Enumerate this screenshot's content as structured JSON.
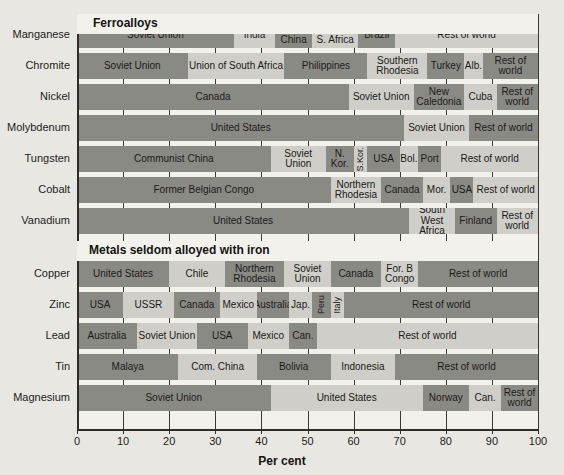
{
  "chart_data": {
    "type": "bar",
    "subtype": "stacked-horizontal-100-percent",
    "title": "",
    "xlabel": "Per cent",
    "ylabel": "",
    "xlim": [
      0,
      100
    ],
    "xticks": [
      0,
      10,
      20,
      30,
      40,
      50,
      60,
      70,
      80,
      90,
      100
    ],
    "grid": true,
    "grid_axis": "x",
    "legend": "none",
    "section_headings": [
      "Ferroalloys",
      "Metals seldom alloyed with iron"
    ],
    "categories": [
      "Manganese",
      "Chromite",
      "Nickel",
      "Molybdenum",
      "Tungsten",
      "Cobalt",
      "Vanadium",
      "Copper",
      "Zinc",
      "Lead",
      "Tin",
      "Magnesium"
    ],
    "colors": {
      "dark_segment": "#8a8a85",
      "light_segment": "#cfcec8",
      "background": "#e8e7e2",
      "plot_background": "#f2f1ec",
      "axis": "#2c2c2a"
    },
    "rows": [
      {
        "category": "Manganese",
        "section": "Ferroalloys",
        "segments": [
          {
            "label": "Soviet Union",
            "value": 34,
            "start": 0,
            "shade": "dark"
          },
          {
            "label": "India",
            "value": 9,
            "start": 34,
            "shade": "light"
          },
          {
            "label": "Com. China",
            "value": 8,
            "start": 43,
            "shade": "dark"
          },
          {
            "label": "Union of S. Africa",
            "value": 10,
            "start": 51,
            "shade": "light"
          },
          {
            "label": "Brazil",
            "value": 8,
            "start": 61,
            "shade": "dark"
          },
          {
            "label": "Rest of world",
            "value": 31,
            "start": 69,
            "shade": "light"
          }
        ]
      },
      {
        "category": "Chromite",
        "section": "Ferroalloys",
        "segments": [
          {
            "label": "Soviet Union",
            "value": 24,
            "start": 0,
            "shade": "dark"
          },
          {
            "label": "Union of South Africa",
            "value": 21,
            "start": 24,
            "shade": "light"
          },
          {
            "label": "Philippines",
            "value": 18,
            "start": 45,
            "shade": "dark"
          },
          {
            "label": "Southern Rhodesia",
            "value": 13,
            "start": 63,
            "shade": "light"
          },
          {
            "label": "Turkey",
            "value": 8,
            "start": 76,
            "shade": "dark"
          },
          {
            "label": "Alb.",
            "value": 4,
            "start": 84,
            "shade": "light"
          },
          {
            "label": "Rest of world",
            "value": 12,
            "start": 88,
            "shade": "dark"
          }
        ]
      },
      {
        "category": "Nickel",
        "section": "Ferroalloys",
        "segments": [
          {
            "label": "Canada",
            "value": 59,
            "start": 0,
            "shade": "dark"
          },
          {
            "label": "Soviet Union",
            "value": 14,
            "start": 59,
            "shade": "light"
          },
          {
            "label": "New Caledonia",
            "value": 11,
            "start": 73,
            "shade": "dark"
          },
          {
            "label": "Cuba",
            "value": 7,
            "start": 84,
            "shade": "light"
          },
          {
            "label": "Rest of world",
            "value": 9,
            "start": 91,
            "shade": "dark"
          }
        ]
      },
      {
        "category": "Molybdenum",
        "section": "Ferroalloys",
        "segments": [
          {
            "label": "United States",
            "value": 71,
            "start": 0,
            "shade": "dark"
          },
          {
            "label": "Soviet Union",
            "value": 14,
            "start": 71,
            "shade": "light"
          },
          {
            "label": "Rest of world",
            "value": 15,
            "start": 85,
            "shade": "dark"
          }
        ]
      },
      {
        "category": "Tungsten",
        "section": "Ferroalloys",
        "segments": [
          {
            "label": "Communist China",
            "value": 42,
            "start": 0,
            "shade": "dark"
          },
          {
            "label": "Soviet Union",
            "value": 12,
            "start": 42,
            "shade": "light"
          },
          {
            "label": "N. Kor.",
            "value": 6,
            "start": 54,
            "shade": "dark"
          },
          {
            "label": "S.Kor.",
            "value": 3,
            "start": 60,
            "shade": "light",
            "orient": "vertical"
          },
          {
            "label": "USA",
            "value": 7,
            "start": 63,
            "shade": "dark"
          },
          {
            "label": "Bol.",
            "value": 4,
            "start": 70,
            "shade": "light"
          },
          {
            "label": "Port",
            "value": 5,
            "start": 74,
            "shade": "dark"
          },
          {
            "label": "Rest of world",
            "value": 21,
            "start": 79,
            "shade": "light"
          }
        ]
      },
      {
        "category": "Cobalt",
        "section": "Ferroalloys",
        "segments": [
          {
            "label": "Former Belgian Congo",
            "value": 55,
            "start": 0,
            "shade": "dark"
          },
          {
            "label": "Northern Rhodesia",
            "value": 11,
            "start": 55,
            "shade": "light"
          },
          {
            "label": "Canada",
            "value": 9,
            "start": 66,
            "shade": "dark"
          },
          {
            "label": "Mor.",
            "value": 6,
            "start": 75,
            "shade": "light"
          },
          {
            "label": "USA",
            "value": 5,
            "start": 81,
            "shade": "dark"
          },
          {
            "label": "Rest of world",
            "value": 14,
            "start": 86,
            "shade": "light"
          }
        ]
      },
      {
        "category": "Vanadium",
        "section": "Ferroalloys",
        "segments": [
          {
            "label": "United States",
            "value": 72,
            "start": 0,
            "shade": "dark"
          },
          {
            "label": "South West Africa",
            "value": 10,
            "start": 72,
            "shade": "light"
          },
          {
            "label": "Finland",
            "value": 9,
            "start": 82,
            "shade": "dark"
          },
          {
            "label": "Rest of world",
            "value": 9,
            "start": 91,
            "shade": "light"
          }
        ]
      },
      {
        "category": "Copper",
        "section": "Metals seldom alloyed with iron",
        "segments": [
          {
            "label": "United States",
            "value": 20,
            "start": 0,
            "shade": "dark"
          },
          {
            "label": "Chile",
            "value": 12,
            "start": 20,
            "shade": "light"
          },
          {
            "label": "Northern Rhodesia",
            "value": 13,
            "start": 32,
            "shade": "dark"
          },
          {
            "label": "Soviet Union",
            "value": 10,
            "start": 45,
            "shade": "light"
          },
          {
            "label": "Canada",
            "value": 11,
            "start": 55,
            "shade": "dark"
          },
          {
            "label": "For. B Congo",
            "value": 8,
            "start": 66,
            "shade": "light"
          },
          {
            "label": "Rest of world",
            "value": 26,
            "start": 74,
            "shade": "dark"
          }
        ]
      },
      {
        "category": "Zinc",
        "section": "Metals seldom alloyed with iron",
        "segments": [
          {
            "label": "USA",
            "value": 10,
            "start": 0,
            "shade": "dark"
          },
          {
            "label": "USSR",
            "value": 11,
            "start": 10,
            "shade": "light"
          },
          {
            "label": "Canada",
            "value": 10,
            "start": 21,
            "shade": "dark"
          },
          {
            "label": "Mexico",
            "value": 8,
            "start": 31,
            "shade": "light"
          },
          {
            "label": "Australia",
            "value": 7,
            "start": 39,
            "shade": "dark"
          },
          {
            "label": "Jap.",
            "value": 5,
            "start": 46,
            "shade": "light"
          },
          {
            "label": "Peru",
            "value": 4,
            "start": 51,
            "shade": "dark",
            "orient": "vertical"
          },
          {
            "label": "Italy",
            "value": 3,
            "start": 55,
            "shade": "light",
            "orient": "vertical"
          },
          {
            "label": "Rest of world",
            "value": 42,
            "start": 58,
            "shade": "dark"
          }
        ]
      },
      {
        "category": "Lead",
        "section": "Metals seldom alloyed with iron",
        "segments": [
          {
            "label": "Australia",
            "value": 13,
            "start": 0,
            "shade": "dark"
          },
          {
            "label": "Soviet Union",
            "value": 13,
            "start": 13,
            "shade": "light"
          },
          {
            "label": "USA",
            "value": 11,
            "start": 26,
            "shade": "dark"
          },
          {
            "label": "Mexico",
            "value": 9,
            "start": 37,
            "shade": "light"
          },
          {
            "label": "Can.",
            "value": 6,
            "start": 46,
            "shade": "dark"
          },
          {
            "label": "Rest of world",
            "value": 48,
            "start": 52,
            "shade": "light"
          }
        ]
      },
      {
        "category": "Tin",
        "section": "Metals seldom alloyed with iron",
        "segments": [
          {
            "label": "Malaya",
            "value": 22,
            "start": 0,
            "shade": "dark"
          },
          {
            "label": "Com. China",
            "value": 17,
            "start": 22,
            "shade": "light"
          },
          {
            "label": "Bolivia",
            "value": 16,
            "start": 39,
            "shade": "dark"
          },
          {
            "label": "Indonesia",
            "value": 14,
            "start": 55,
            "shade": "light"
          },
          {
            "label": "Rest of world",
            "value": 31,
            "start": 69,
            "shade": "dark"
          }
        ]
      },
      {
        "category": "Magnesium",
        "section": "Metals seldom alloyed with iron",
        "segments": [
          {
            "label": "Soviet Union",
            "value": 42,
            "start": 0,
            "shade": "dark"
          },
          {
            "label": "United States",
            "value": 33,
            "start": 42,
            "shade": "light"
          },
          {
            "label": "Norway",
            "value": 10,
            "start": 75,
            "shade": "dark"
          },
          {
            "label": "Can.",
            "value": 7,
            "start": 85,
            "shade": "light"
          },
          {
            "label": "Rest of world",
            "value": 8,
            "start": 92,
            "shade": "dark"
          }
        ]
      }
    ]
  }
}
